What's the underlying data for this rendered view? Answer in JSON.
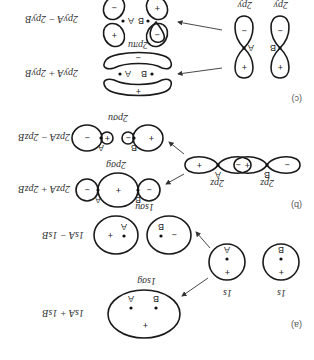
{
  "figure": {
    "orientation": "rotated-180",
    "panels": [
      {
        "id": "a",
        "label": "(a)",
        "atomic_orbitals": [
          {
            "name": "1s",
            "atom": "A",
            "sign": "+"
          },
          {
            "name": "1s",
            "atom": "B",
            "sign": "+"
          }
        ],
        "molecular_orbitals": [
          {
            "combination": "1s_A + 1s_B",
            "name": "1sσ_g",
            "signs": [
              "+"
            ],
            "atoms": [
              "A",
              "B"
            ]
          },
          {
            "combination": "1s_A − 1s_B",
            "name": "1sσ_u",
            "signs": [
              "+",
              "−"
            ],
            "atoms": [
              "A",
              "B"
            ]
          }
        ]
      },
      {
        "id": "b",
        "label": "(b)",
        "atomic_orbitals": [
          {
            "name": "2p_z",
            "atom": "A",
            "signs": [
              "−",
              "+"
            ]
          },
          {
            "name": "2p_z",
            "atom": "B",
            "signs": [
              "+",
              "−"
            ]
          }
        ],
        "molecular_orbitals": [
          {
            "combination": "2p_zA + 2p_zB",
            "name": "2pσ_g",
            "signs": [
              "−",
              "+",
              "−"
            ],
            "atoms": [
              "A",
              "B"
            ]
          },
          {
            "combination": "2p_zA − 2p_zB",
            "name": "2pσ_u",
            "signs": [
              "−",
              "+",
              "−",
              "+"
            ],
            "atoms": [
              "A",
              "B"
            ]
          }
        ]
      },
      {
        "id": "c",
        "label": "(c)",
        "atomic_orbitals": [
          {
            "name": "2p_y",
            "atom": "A",
            "signs": [
              "+",
              "−"
            ]
          },
          {
            "name": "2p_y",
            "atom": "B",
            "signs": [
              "+",
              "−"
            ]
          }
        ],
        "molecular_orbitals": [
          {
            "combination": "2p_yA + 2p_yB",
            "name": "2pπ_u",
            "signs": [
              "+",
              "−"
            ],
            "atoms": [
              "A",
              "B"
            ]
          },
          {
            "combination": "2p_yA − 2p_yB",
            "name": "2pπ_g",
            "signs": [
              "+",
              "−",
              "−",
              "+"
            ],
            "atoms": [
              "A",
              "B"
            ]
          }
        ]
      }
    ],
    "text": {
      "a_label": "(a)",
      "b_label": "(b)",
      "c_label": "(c)",
      "s": "1s",
      "sigma_g_1s": "1sσg",
      "sigma_u_1s": "1sσu",
      "sum_1s": "1sA + 1sB",
      "diff_1s": "1sA − 1sB",
      "pz": "2pz",
      "sigma_g_2p": "2pσg",
      "sigma_u_2p": "2pσu",
      "sum_2pz": "2pzA + 2pzB",
      "diff_2pz": "2pzA − 2pzB",
      "py": "2py",
      "pi_u": "2pπu",
      "pi_g": "2pπg",
      "sum_2py": "2pyA + 2pyB",
      "diff_2py": "2pyA − 2pyB",
      "atom_a": "A",
      "atom_b": "B",
      "plus": "+",
      "minus": "−"
    }
  }
}
